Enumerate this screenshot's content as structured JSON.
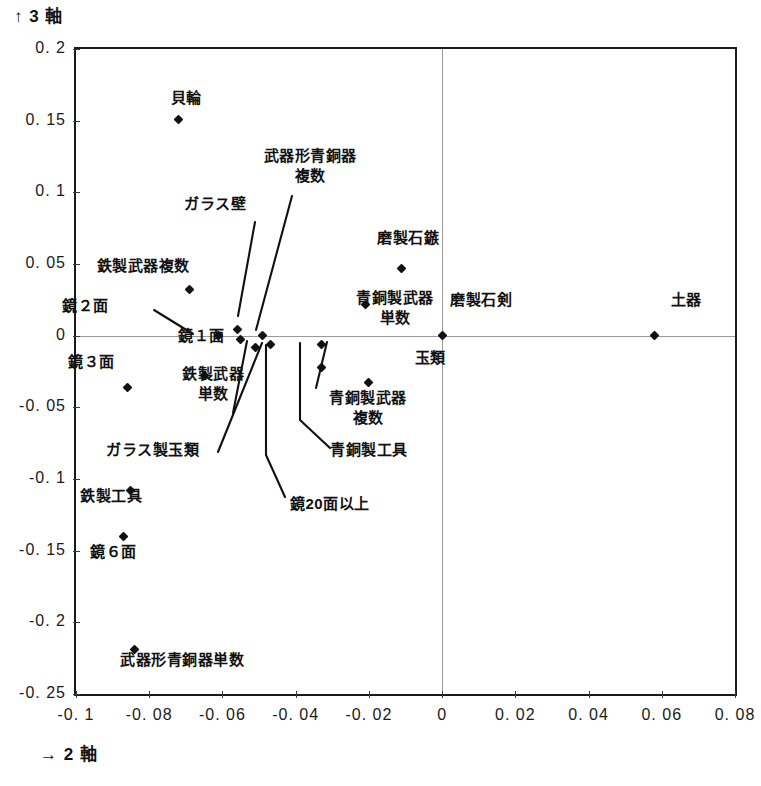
{
  "chart_data": {
    "type": "scatter",
    "title": "",
    "xlabel": "→ 2 軸",
    "ylabel": "↑ 3 軸",
    "xlim": [
      -0.1,
      0.08
    ],
    "ylim": [
      -0.25,
      0.2
    ],
    "grid": false,
    "legend": "none",
    "xticks": [
      "-0.1",
      "-0.08",
      "-0.06",
      "-0.04",
      "-0.02",
      "0",
      "0.02",
      "0.04",
      "0.06",
      "0.08"
    ],
    "xtick_values": [
      -0.1,
      -0.08,
      -0.06,
      -0.04,
      -0.02,
      0,
      0.02,
      0.04,
      0.06,
      0.08
    ],
    "yticks": [
      "0. 2",
      "0. 15",
      "0. 1",
      "0. 05",
      "0",
      "-0. 05",
      "-0. 1",
      "-0. 15",
      "-0. 2",
      "-0. 25"
    ],
    "ytick_values": [
      0.2,
      0.15,
      0.1,
      0.05,
      0,
      -0.05,
      -0.1,
      -0.15,
      -0.2,
      -0.25
    ],
    "points": [
      {
        "label": "貝輪",
        "x": -0.072,
        "y": 0.151
      },
      {
        "label": "鉄製武器複数",
        "x": -0.069,
        "y": 0.032
      },
      {
        "label": "磨製石鏃",
        "x": -0.011,
        "y": 0.047
      },
      {
        "label": "青銅製武器\n単数",
        "x": -0.021,
        "y": 0.022
      },
      {
        "label": "ガラス壁",
        "x": -0.056,
        "y": 0.004
      },
      {
        "label": "武器形青銅器\n複数",
        "x": -0.049,
        "y": 0.0
      },
      {
        "label": "鏡２面",
        "x": -0.061,
        "y": 0.0
      },
      {
        "label": "鏡１面",
        "x": -0.055,
        "y": -0.003
      },
      {
        "label": "磨製石剣",
        "x": 0.0,
        "y": 0.0
      },
      {
        "label": "土器",
        "x": 0.058,
        "y": 0.0
      },
      {
        "label": "青銅製工具",
        "x": -0.033,
        "y": -0.006
      },
      {
        "label": "鏡20面以上",
        "x": -0.047,
        "y": -0.006
      },
      {
        "label": "ガラス製玉類",
        "x": -0.051,
        "y": -0.008
      },
      {
        "label": "玉類",
        "x": -0.02,
        "y": -0.033
      },
      {
        "label": "青銅製武器\n複数",
        "x": -0.033,
        "y": -0.022
      },
      {
        "label": "鉄製武器\n単数",
        "x": -0.065,
        "y": -0.028
      },
      {
        "label": "鏡３面",
        "x": -0.086,
        "y": -0.036
      },
      {
        "label": "鉄製工具",
        "x": -0.085,
        "y": -0.108
      },
      {
        "label": "鏡６面",
        "x": -0.087,
        "y": -0.14
      },
      {
        "label": "武器形青銅器単数",
        "x": -0.084,
        "y": -0.219
      }
    ]
  },
  "axes": {
    "y_title": "↑ 3 軸",
    "x_title": "→ 2 軸"
  },
  "labels": {
    "kaiwa": "貝輪",
    "tetsusei_buki_fukusu": "鉄製武器複数",
    "busuki_seidouki_fukusu_l1": "武器形青銅器",
    "busuki_seidouki_fukusu_l2": "複数",
    "garasu_heki": "ガラス壁",
    "masei_sekizoku": "磨製石鏃",
    "seidousei_buki_tansu_l1": "青銅製武器",
    "seidousei_buki_tansu_l2": "単数",
    "masei_sekken": "磨製石剣",
    "doki": "土器",
    "kagami_2men": "鏡２面",
    "kagami_1men": "鏡１面",
    "kagami_3men": "鏡３面",
    "tetsusei_buki_tansu_l1": "鉄製武器",
    "tetsusei_buki_tansu_l2": "単数",
    "tamarui": "玉類",
    "seidousei_buki_fukusu_l1": "青銅製武器",
    "seidousei_buki_fukusu_l2": "複数",
    "garasu_sei_tamarui": "ガラス製玉類",
    "seidousei_kougu": "青銅製工具",
    "kagami_20men_ijou": "鏡20面以上",
    "tetsusei_kougu": "鉄製工具",
    "kagami_6men": "鏡６面",
    "busuki_seidouki_tansu": "武器形青銅器単数"
  },
  "ticks": {
    "y": [
      "0. 2",
      "0. 15",
      "0. 1",
      "0. 05",
      "0",
      "-0. 05",
      "-0. 1",
      "-0. 15",
      "-0. 2",
      "-0. 25"
    ],
    "x": [
      "-0. 1",
      "-0. 08",
      "-0. 06",
      "-0. 04",
      "-0. 02",
      "0",
      "0. 02",
      "0. 04",
      "0. 06",
      "0. 08"
    ]
  },
  "colors": {
    "ink": "#111111",
    "frame": "#1a1a1a",
    "zero_line": "#9a9a9a",
    "background": "#ffffff"
  }
}
